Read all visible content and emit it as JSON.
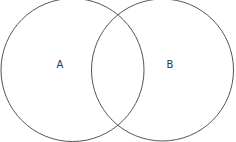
{
  "diagram": {
    "type": "venn",
    "sets": [
      {
        "label": "A",
        "cx": 72.5,
        "cy": 70,
        "r": 71.5
      },
      {
        "label": "B",
        "cx": 162.5,
        "cy": 70,
        "r": 71
      }
    ],
    "stroke_color": "#555555",
    "background": "#ffffff"
  }
}
